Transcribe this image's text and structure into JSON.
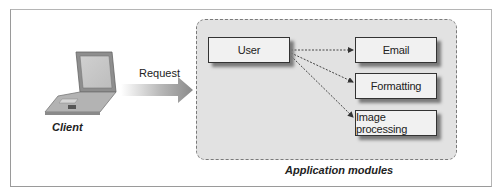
{
  "diagram": {
    "client_label": "Client",
    "request_label": "Request",
    "container_label": "Application modules",
    "source_module": "User",
    "target_modules": [
      "Email",
      "Formatting",
      "Image processing"
    ],
    "edges": [
      {
        "from": "User",
        "to": "Email",
        "style": "dotted"
      },
      {
        "from": "User",
        "to": "Formatting",
        "style": "dotted"
      },
      {
        "from": "User",
        "to": "Image processing",
        "style": "dotted"
      }
    ],
    "icons": [
      "laptop-icon",
      "request-arrow-icon"
    ]
  }
}
